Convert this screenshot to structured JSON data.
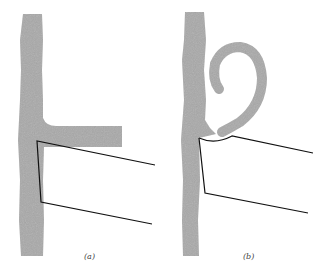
{
  "figure": {
    "panels": [
      {
        "id": "a",
        "label": "(a)",
        "description": "Vertical gray stalk with straight horizontal arm; open wedge outline below arm"
      },
      {
        "id": "b",
        "label": "(b)",
        "description": "Vertical gray stalk with arm curled into a spiral hook; wedge outline below with curved top edge"
      }
    ],
    "colors": {
      "shape_fill": "#a9a9a9",
      "line": "#111111",
      "background": "#ffffff"
    }
  }
}
